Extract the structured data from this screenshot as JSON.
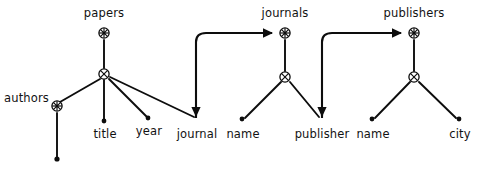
{
  "diagram": {
    "type": "schema-tree",
    "width": 496,
    "height": 174,
    "background_color": "#ffffff",
    "stroke_color": "#0d0d0d",
    "roots": [
      {
        "id": "papers",
        "label": "papers",
        "node_icon": "root-star-node",
        "position": {
          "x": 104,
          "y": 33
        },
        "junction": {
          "x": 104,
          "y": 74,
          "icon": "cross-circle-node"
        },
        "children": [
          {
            "label": "authors",
            "kind": "subtree-root",
            "x": 57,
            "y": 106
          },
          {
            "label": "title",
            "kind": "leaf",
            "x": 104,
            "y": 122
          },
          {
            "label": "year",
            "kind": "leaf",
            "x": 148,
            "y": 119
          },
          {
            "label": "journal",
            "kind": "leaf",
            "x": 196,
            "y": 121
          }
        ]
      },
      {
        "id": "journals",
        "label": "journals",
        "node_icon": "root-star-node",
        "position": {
          "x": 285,
          "y": 33
        },
        "junction": {
          "x": 285,
          "y": 77,
          "icon": "cross-circle-node"
        },
        "children": [
          {
            "label": "name",
            "kind": "leaf",
            "x": 242,
            "y": 122
          },
          {
            "label": "publisher",
            "kind": "leaf",
            "x": 322,
            "y": 122
          }
        ]
      },
      {
        "id": "publishers",
        "label": "publishers",
        "node_icon": "root-star-node",
        "position": {
          "x": 414,
          "y": 33
        },
        "junction": {
          "x": 414,
          "y": 77,
          "icon": "cross-circle-node"
        },
        "children": [
          {
            "label": "name",
            "kind": "leaf",
            "x": 372,
            "y": 122
          },
          {
            "label": "city",
            "kind": "leaf",
            "x": 459,
            "y": 122
          }
        ]
      }
    ],
    "subtrees": [
      {
        "id": "authors",
        "label": "authors",
        "node_icon": "root-star-node",
        "position": {
          "x": 57,
          "y": 106
        },
        "leaf": {
          "x": 57,
          "y": 160,
          "kind": "leaf-dot"
        }
      }
    ],
    "references": [
      {
        "id": "journal-to-journals",
        "from_label": "journal",
        "to_label": "journals",
        "arrow": "arrowhead-right",
        "style": "curved-elbow"
      },
      {
        "id": "publisher-to-publishers",
        "from_label": "publisher",
        "to_label": "publishers",
        "arrow": "arrowhead-right",
        "style": "curved-elbow"
      },
      {
        "id": "papers-to-journal",
        "from_label": "papers",
        "to_label": "journal",
        "arrow": "arrowhead-down",
        "style": "straight"
      },
      {
        "id": "journals-to-publisher",
        "from_label": "journals",
        "to_label": "publisher",
        "arrow": "arrowhead-down",
        "style": "straight"
      }
    ],
    "labels": {
      "papers": "papers",
      "journals": "journals",
      "publishers": "publishers",
      "authors": "authors",
      "title": "title",
      "year": "year",
      "journal": "journal",
      "journals_name": "name",
      "publisher": "publisher",
      "publishers_name": "name",
      "city": "city"
    }
  }
}
